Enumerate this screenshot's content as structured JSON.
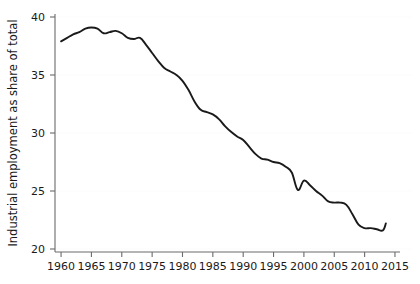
{
  "chart_data": {
    "type": "line",
    "title": "",
    "subtitle": "",
    "xlabel": "",
    "ylabel": "Industrial employment as share of total",
    "xlim": [
      1959,
      2015.5
    ],
    "ylim": [
      20,
      40
    ],
    "grid": true,
    "legend": null,
    "x_ticks": [
      1960,
      1965,
      1970,
      1975,
      1980,
      1985,
      1990,
      1995,
      2000,
      2005,
      2010,
      2015
    ],
    "x_tick_labels": [
      "1960",
      "1965",
      "1970",
      "1975",
      "1980",
      "1985",
      "1990",
      "1995",
      "2000",
      "2005",
      "2010",
      "2015"
    ],
    "y_ticks": [
      20,
      25,
      30,
      35,
      40
    ],
    "y_tick_labels": [
      "20",
      "25",
      "30",
      "35",
      "40"
    ],
    "line_color": "#1a1a1a",
    "series": [
      {
        "name": "Industrial employment as share of total",
        "x": [
          1960,
          1961,
          1962,
          1963,
          1964,
          1965,
          1966,
          1967,
          1968,
          1969,
          1970,
          1971,
          1972,
          1973,
          1974,
          1975,
          1976,
          1977,
          1978,
          1979,
          1980,
          1981,
          1982,
          1983,
          1984,
          1985,
          1986,
          1987,
          1988,
          1989,
          1990,
          1991,
          1992,
          1993,
          1994,
          1995,
          1996,
          1997,
          1998,
          1999,
          2000,
          2001,
          2002,
          2003,
          2004,
          2005,
          2006,
          2007,
          2008,
          2009,
          2010,
          2011,
          2012,
          2013,
          2013.5
        ],
        "values": [
          37.9,
          38.2,
          38.5,
          38.7,
          39.0,
          39.1,
          39.0,
          38.6,
          38.7,
          38.8,
          38.6,
          38.2,
          38.1,
          38.2,
          37.6,
          36.9,
          36.2,
          35.6,
          35.3,
          35.0,
          34.5,
          33.7,
          32.7,
          32.0,
          31.8,
          31.6,
          31.2,
          30.6,
          30.1,
          29.7,
          29.4,
          28.8,
          28.2,
          27.8,
          27.7,
          27.5,
          27.4,
          27.1,
          26.6,
          25.1,
          25.9,
          25.5,
          25.0,
          24.6,
          24.1,
          24.0,
          24.0,
          23.8,
          23.0,
          22.1,
          21.8,
          21.8,
          21.7,
          21.6,
          22.2
        ]
      }
    ]
  },
  "axes": {
    "y_axis_title": "Industrial employment as share of total"
  }
}
